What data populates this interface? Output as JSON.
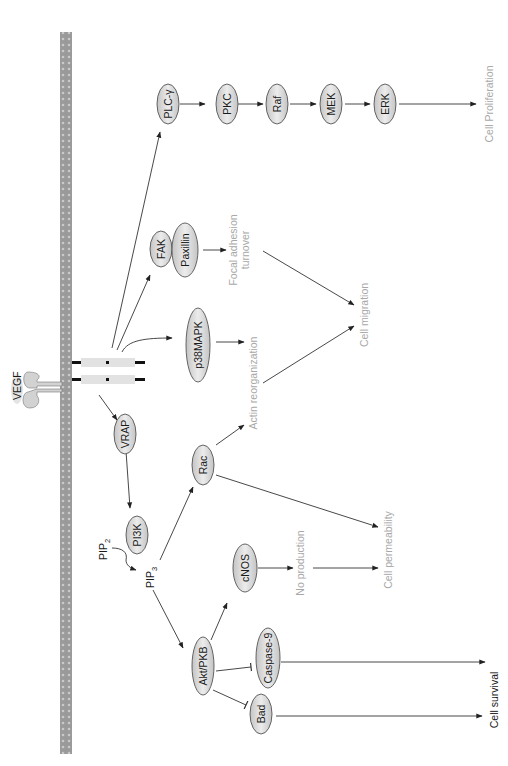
{
  "diagram": {
    "orientation": "rotated 90 degrees counter-clockwise",
    "colors": {
      "membrane": "#9a9a9a",
      "node_fill": "#d9d9d9",
      "node_stroke": "#555555",
      "edge": "#333333",
      "outcome_text": "#a8a8a8",
      "receptor": "#e2e2e2"
    },
    "ligand": {
      "label": "VEGF"
    },
    "nodes": {
      "plc": "PLC-γ",
      "pkc": "PKC",
      "raf": "Raf",
      "mek": "MEK",
      "erk": "ERK",
      "fak": "FAK",
      "paxillin": "Paxillin",
      "p38": "p38MAPK",
      "vrap": "VRAP",
      "pi3k": "PI3K",
      "rac": "Rac",
      "cnos": "cNOS",
      "akt": "Akt/PKB",
      "caspase9": "Caspase-9",
      "bad": "Bad"
    },
    "metabolites": {
      "pip2_base": "PIP",
      "pip2_sub": "2",
      "pip3_base": "PIP",
      "pip3_sub": "3"
    },
    "outcomes": {
      "proliferation": "Cell Proliferation",
      "focal_line1": "Focal adhesion",
      "focal_line2": "turnover",
      "actin": "Actin reorganization",
      "migration": "Cell migration",
      "no_production": "No production",
      "permeability": "Cell permeability",
      "survival": "Cell survival"
    }
  }
}
